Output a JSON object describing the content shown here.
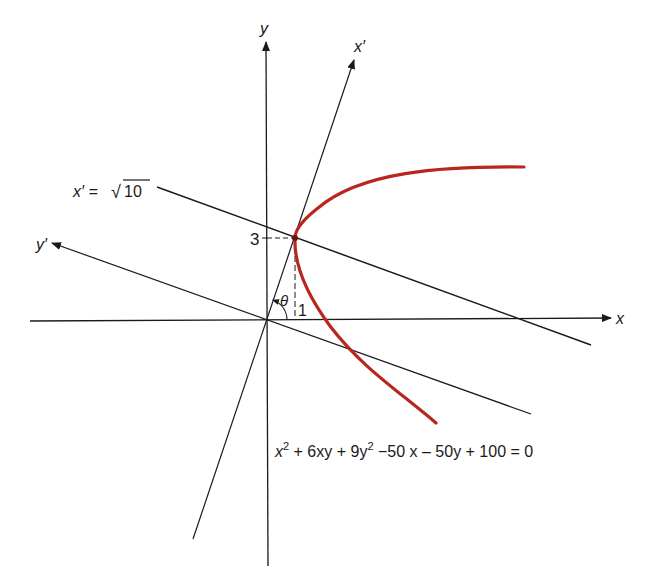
{
  "figure": {
    "axes": {
      "x_label": "x",
      "y_label": "y",
      "x_prime_label": "x′",
      "y_prime_label": "y′"
    },
    "line_label": {
      "lhs": "x′ =",
      "sqrt_symbol": "√",
      "radicand": "10"
    },
    "tick_labels": {
      "y_value": "3",
      "x_value": "1"
    },
    "angle_label": "θ",
    "equation": {
      "t1": "x",
      "t1_sup": "2",
      "t2": " + 6xy + 9y",
      "t2_sup": "2",
      "t3": " −50 x – 50y + 100 = 0"
    },
    "colors": {
      "curve": "#b9261e",
      "axes": "#1a1a1a",
      "background": "#ffffff"
    },
    "geometry": {
      "origin": [
        0,
        0
      ],
      "highlight_point": [
        1,
        3
      ],
      "rotation_angle": "θ = arctan(3)",
      "curve_type": "parabola"
    }
  }
}
